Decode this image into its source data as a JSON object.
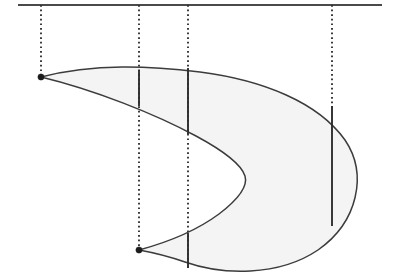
{
  "figure": {
    "canvas": {
      "width": 402,
      "height": 275,
      "background": "#ffffff"
    },
    "colors": {
      "axis": "#4a4a4a",
      "guide": "#333333",
      "outline": "#3c3c3c",
      "fill": "#f4f4f4",
      "chord": "#2e2e2e",
      "vertex": "#1c1c1c",
      "watermark": "#f0f0f0"
    }
  },
  "axis": {
    "label": "horizontal reference line",
    "y": 5,
    "x_start": 18,
    "x_end": 382
  },
  "guides": [
    {
      "name": "guide-1",
      "x": 41,
      "y_start": 5,
      "y_end": 79,
      "style": "dotted"
    },
    {
      "name": "guide-2",
      "x": 139,
      "y_start": 5,
      "y_end": 251,
      "style": "dotted"
    },
    {
      "name": "guide-3",
      "x": 188,
      "y_start": 5,
      "y_end": 268,
      "style": "dotted"
    },
    {
      "name": "guide-4",
      "x": 332,
      "y_start": 5,
      "y_end": 110,
      "style": "dotted"
    }
  ],
  "region": {
    "name": "crescent-region",
    "outline_path": "M 41 77 C 95 63 150 66 200 72 C 262 80 318 102 345 140 C 368 174 358 222 318 250 C 278 277 222 275 185 262 C 165 255 150 252 139 250 C 165 243 196 231 219 214 C 240 198 248 186 245 176 C 241 163 222 150 196 136 C 155 114 95 90 41 77 Z",
    "fill": "#f4f4f4",
    "left_cusp": {
      "x": 41,
      "y": 77
    },
    "bottom_cusp": {
      "x": 139,
      "y": 250
    },
    "inner_apex": {
      "x": 245,
      "y": 180
    },
    "rightmost": {
      "x": 362,
      "y": 172
    },
    "bottom_most": {
      "x": 232,
      "y": 268
    }
  },
  "chords": [
    {
      "name": "chord-a",
      "x": 139,
      "y_top": 70,
      "y_bottom": 106
    },
    {
      "name": "chord-b-upper",
      "x": 188,
      "y_top": 68,
      "y_bottom": 134
    },
    {
      "name": "chord-b-lower",
      "x": 188,
      "y_top": 233,
      "y_bottom": 268
    },
    {
      "name": "chord-c",
      "x": 332,
      "y_top": 106,
      "y_bottom": 226
    }
  ],
  "vertices": [
    {
      "name": "vertex-left",
      "x": 41,
      "y": 77,
      "radius": 3.1
    },
    {
      "name": "vertex-bottom",
      "x": 139,
      "y": 250,
      "radius": 3.1
    }
  ],
  "watermarks": [
    {
      "name": "watermark-upper",
      "text": "",
      "x": 205,
      "y": 148
    },
    {
      "name": "watermark-lower",
      "text": "",
      "x": 225,
      "y": 232
    }
  ]
}
